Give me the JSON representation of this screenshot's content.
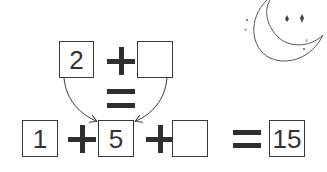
{
  "puzzle": {
    "top_row": {
      "left_box": "2",
      "operator": "+",
      "right_box": ""
    },
    "middle_equals": "=",
    "bottom_row": {
      "box1": "1",
      "op1": "+",
      "box2": "5",
      "op2": "+",
      "box3": "",
      "equals": "=",
      "result_box": "15"
    }
  },
  "decoration": {
    "icon": "crescent-moon-with-stars-icon"
  },
  "colors": {
    "stroke": "#3a3a3a",
    "operator": "#2f2f2f",
    "background": "#ffffff"
  }
}
